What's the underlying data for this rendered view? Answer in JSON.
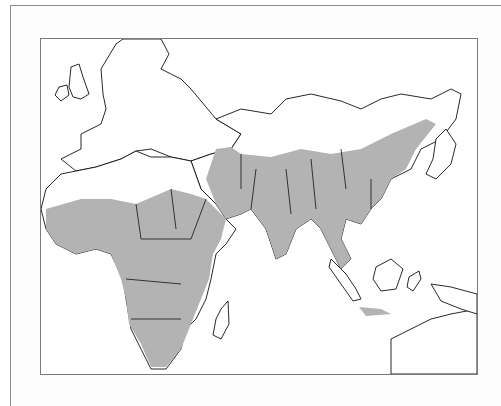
{
  "figure": {
    "title": "Distribution range map",
    "region": "Africa, Europe and Asia",
    "legend": {
      "shaded_label": "Range (shaded)",
      "shade_color": "#b3b3b3",
      "land_color": "#ffffff",
      "outline_color": "#111111"
    },
    "shaded_regions": [
      "Sub-Saharan Africa",
      "Arabian Peninsula coast",
      "Iran and Central Asia",
      "Indian subcontinent",
      "China",
      "Southeast Asia",
      "Java"
    ]
  }
}
